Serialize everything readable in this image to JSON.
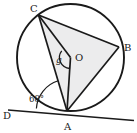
{
  "figure": {
    "kind": "circle-geometry-diagram",
    "background_color": "#ffffff",
    "stroke_color": "#1a1a1a",
    "shade_color": "#ececed"
  },
  "circle": {
    "name": "main-circle",
    "center_label": "O",
    "cx": 70.5,
    "cy": 57.5,
    "r": 53.5,
    "stroke_width": 1.9
  },
  "points": [
    {
      "id": "C",
      "label": "C",
      "x": 38.5,
      "y": 15.0,
      "label_x": 30.0,
      "label_y": 12.0
    },
    {
      "id": "B",
      "label": "B",
      "x": 119.0,
      "y": 47.0,
      "label_x": 124.0,
      "label_y": 51.0
    },
    {
      "id": "A",
      "label": "A",
      "x": 67.0,
      "y": 111.0,
      "label_x": 64.0,
      "label_y": 130.0
    },
    {
      "id": "O",
      "label": "O",
      "x": 70.5,
      "y": 57.5,
      "label_x": 75.0,
      "label_y": 61.0
    },
    {
      "id": "D",
      "label": "D",
      "x": 13.0,
      "y": 112.0,
      "label_x": 4.0,
      "label_y": 119.0
    }
  ],
  "segments": [
    {
      "id": "CB",
      "name": "chord-c-b",
      "from": "C",
      "to": "B"
    },
    {
      "id": "BA",
      "name": "chord-b-a",
      "from": "B",
      "to": "A"
    },
    {
      "id": "AC",
      "name": "chord-a-c",
      "from": "A",
      "to": "C"
    },
    {
      "id": "OC",
      "name": "radius-o-c",
      "from": "O",
      "to": "C"
    },
    {
      "id": "OA",
      "name": "radius-o-a",
      "from": "O",
      "to": "A"
    }
  ],
  "shaded_region": {
    "name": "triangle-c-b-a",
    "vertices": [
      "C",
      "B",
      "A"
    ],
    "fill": "#ececed"
  },
  "tangent": {
    "name": "tangent-line-through-a",
    "label": "D",
    "x1": 8.0,
    "y1": 110.0,
    "x2": 134.0,
    "y2": 120.5
  },
  "angles": [
    {
      "id": "g",
      "name": "central-angle-g",
      "label": "g",
      "vertex": "O",
      "between": [
        "OC",
        "OA"
      ],
      "label_x": 57.0,
      "label_y": 62.0,
      "arc_radius": 11.0
    },
    {
      "id": "tangent-chord",
      "name": "tangent-chord-angle",
      "label": "68°",
      "vertex": "A",
      "between": [
        "AD",
        "AC"
      ],
      "label_x": 32.0,
      "label_y": 102.0,
      "arc_radius": 31.0
    }
  ]
}
